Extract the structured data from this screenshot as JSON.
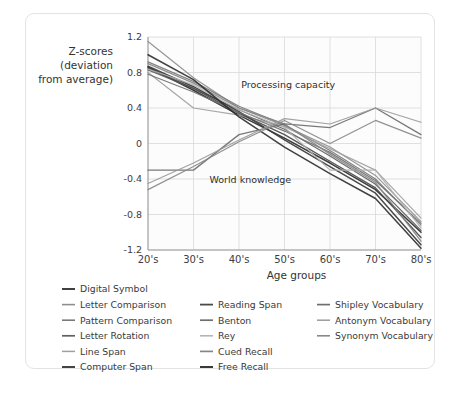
{
  "chart_data": {
    "type": "line",
    "title": "",
    "xlabel": "Age groups",
    "ylabel": "Z-scores (deviation from average)",
    "ylabel_lines": [
      "Z-scores",
      "(deviation",
      "from average)"
    ],
    "categories": [
      "20's",
      "30's",
      "40's",
      "50's",
      "60's",
      "70's",
      "80's"
    ],
    "x": [
      0,
      1,
      2,
      3,
      4,
      5,
      6
    ],
    "ylim": [
      -1.2,
      1.2
    ],
    "yticks": [
      1.2,
      0.8,
      0.4,
      0,
      -0.4,
      -0.8,
      -1.2
    ],
    "ytick_labels": [
      "1.2",
      "0.8",
      "0.4",
      "0",
      "-0.4",
      "-0.8",
      "-1.2"
    ],
    "grid": true,
    "legend_position": "below",
    "annotations": [
      {
        "text": "Processing capacity",
        "x": 2.05,
        "y": 0.62
      },
      {
        "text": "World knowledge",
        "x": 1.35,
        "y": -0.44
      }
    ],
    "series": [
      {
        "name": "Digital Symbol",
        "color": "#2b2b2b",
        "width": 1.5,
        "values": [
          0.86,
          0.6,
          0.32,
          0.06,
          -0.22,
          -0.52,
          -1.0
        ]
      },
      {
        "name": "Letter Comparison",
        "color": "#8e8e8e",
        "width": 1.2,
        "values": [
          1.15,
          0.74,
          0.4,
          0.2,
          -0.04,
          -0.36,
          -0.88
        ]
      },
      {
        "name": "Pattern Comparison",
        "color": "#7a7a7a",
        "width": 1.2,
        "values": [
          0.92,
          0.7,
          0.42,
          0.21,
          -0.08,
          -0.4,
          -0.92
        ]
      },
      {
        "name": "Letter Rotation",
        "color": "#606060",
        "width": 1.2,
        "values": [
          0.83,
          0.62,
          0.38,
          0.16,
          -0.14,
          -0.46,
          -0.98
        ]
      },
      {
        "name": "Line Span",
        "color": "#a0a0a0",
        "width": 1.2,
        "values": [
          0.8,
          0.4,
          0.32,
          0.19,
          -0.06,
          -0.3,
          -0.84
        ]
      },
      {
        "name": "Computer Span",
        "color": "#3a3a3a",
        "width": 1.5,
        "values": [
          0.87,
          0.64,
          0.36,
          0.04,
          -0.26,
          -0.56,
          -1.14
        ]
      },
      {
        "name": "Reading Span",
        "color": "#4a4a4a",
        "width": 1.4,
        "values": [
          0.85,
          0.62,
          0.34,
          0.1,
          -0.2,
          -0.5,
          -1.06
        ]
      },
      {
        "name": "Benton",
        "color": "#707070",
        "width": 1.2,
        "values": [
          0.78,
          0.58,
          0.35,
          0.14,
          -0.1,
          -0.42,
          -0.9
        ]
      },
      {
        "name": "Rey",
        "color": "#b0b0b0",
        "width": 1.2,
        "values": [
          0.84,
          0.66,
          0.38,
          0.18,
          -0.3,
          -0.3,
          -0.95
        ]
      },
      {
        "name": "Cued Recall",
        "color": "#868686",
        "width": 1.3,
        "values": [
          0.9,
          0.68,
          0.4,
          0.22,
          -0.12,
          -0.44,
          -1.1
        ]
      },
      {
        "name": "Free Recall",
        "color": "#303030",
        "width": 1.5,
        "values": [
          1.0,
          0.72,
          0.3,
          -0.04,
          -0.34,
          -0.62,
          -1.18
        ]
      },
      {
        "name": "Shipley Vocabulary",
        "color": "#6e6e6e",
        "width": 1.3,
        "values": [
          -0.3,
          -0.3,
          0.1,
          0.22,
          0.18,
          0.4,
          0.1
        ]
      },
      {
        "name": "Antonym Vocabulary",
        "color": "#9a9a9a",
        "width": 1.2,
        "values": [
          -0.45,
          -0.22,
          0.04,
          0.28,
          0.22,
          0.4,
          0.24
        ]
      },
      {
        "name": "Synonym Vocabulary",
        "color": "#888888",
        "width": 1.2,
        "values": [
          -0.52,
          -0.26,
          0.02,
          0.26,
          0.0,
          0.26,
          0.06
        ]
      }
    ]
  },
  "legend": {
    "columns": [
      {
        "items": [
          {
            "label": "Digital Symbol",
            "color": "#2b2b2b",
            "width": 1.8
          },
          {
            "label": "Letter Comparison",
            "color": "#8e8e8e",
            "width": 1.6
          },
          {
            "label": "Pattern Comparison",
            "color": "#7a7a7a",
            "width": 1.6
          },
          {
            "label": "Letter Rotation",
            "color": "#606060",
            "width": 1.7
          },
          {
            "label": "Line Span",
            "color": "#a0a0a0",
            "width": 1.5
          },
          {
            "label": "Computer Span",
            "color": "#3a3a3a",
            "width": 1.9
          }
        ]
      },
      {
        "items": [
          {
            "label": "Reading Span",
            "color": "#4a4a4a",
            "width": 1.8
          },
          {
            "label": "Benton",
            "color": "#707070",
            "width": 1.7
          },
          {
            "label": "Rey",
            "color": "#b0b0b0",
            "width": 1.5
          },
          {
            "label": "Cued Recall",
            "color": "#868686",
            "width": 1.7
          },
          {
            "label": "Free Recall",
            "color": "#303030",
            "width": 1.9
          }
        ]
      },
      {
        "items": [
          {
            "label": "Shipley Vocabulary",
            "color": "#6e6e6e",
            "width": 1.7
          },
          {
            "label": "Antonym Vocabulary",
            "color": "#9a9a9a",
            "width": 1.5
          },
          {
            "label": "Synonym Vocabulary",
            "color": "#888888",
            "width": 1.6
          }
        ]
      }
    ]
  }
}
